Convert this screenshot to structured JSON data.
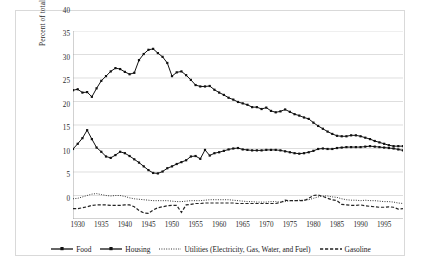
{
  "chart_data": {
    "type": "line",
    "title": "",
    "xlabel": "",
    "ylabel": "Percent of total consumer expenditures",
    "xlim": [
      1929,
      1999
    ],
    "ylim": [
      0,
      40
    ],
    "ytick_labels": [
      "0",
      "5",
      "10",
      "15",
      "20",
      "25",
      "30",
      "35",
      "40"
    ],
    "ytick_values": [
      0,
      5,
      10,
      15,
      20,
      25,
      30,
      35,
      40
    ],
    "xtick_labels": [
      "1930",
      "1935",
      "1940",
      "1945",
      "1950",
      "1955",
      "1960",
      "1965",
      "1970",
      "1975",
      "1980",
      "1985",
      "1990",
      "1995"
    ],
    "xtick_values": [
      1930,
      1935,
      1940,
      1945,
      1950,
      1955,
      1960,
      1965,
      1970,
      1975,
      1980,
      1985,
      1990,
      1995
    ],
    "grid": "horizontal",
    "legend_position": "bottom",
    "x": [
      1929,
      1930,
      1931,
      1932,
      1933,
      1934,
      1935,
      1936,
      1937,
      1938,
      1939,
      1940,
      1941,
      1942,
      1943,
      1944,
      1945,
      1946,
      1947,
      1948,
      1949,
      1950,
      1951,
      1952,
      1953,
      1954,
      1955,
      1956,
      1957,
      1958,
      1959,
      1960,
      1961,
      1962,
      1963,
      1964,
      1965,
      1966,
      1967,
      1968,
      1969,
      1970,
      1971,
      1972,
      1973,
      1974,
      1975,
      1976,
      1977,
      1978,
      1979,
      1980,
      1981,
      1982,
      1983,
      1984,
      1985,
      1986,
      1987,
      1988,
      1989,
      1990,
      1991,
      1992,
      1993,
      1994,
      1995,
      1996,
      1997,
      1998,
      1999
    ],
    "series": [
      {
        "name": "Food",
        "style": "solid-marker",
        "color": "#111111",
        "values": [
          27.4,
          27.6,
          26.9,
          27.0,
          26.0,
          27.8,
          29.4,
          30.4,
          31.4,
          32.1,
          31.9,
          31.3,
          30.8,
          31.1,
          33.8,
          35.1,
          36.0,
          36.2,
          35.3,
          34.5,
          33.2,
          30.4,
          31.2,
          31.4,
          30.6,
          29.6,
          28.5,
          28.2,
          28.2,
          28.3,
          27.5,
          26.9,
          26.4,
          25.8,
          25.4,
          24.9,
          24.6,
          24.3,
          23.8,
          23.8,
          23.4,
          23.7,
          23.0,
          22.7,
          22.9,
          23.3,
          22.8,
          22.3,
          22.0,
          21.6,
          21.3,
          20.5,
          19.8,
          19.2,
          18.6,
          18.1,
          17.7,
          17.6,
          17.6,
          17.8,
          17.8,
          17.6,
          17.3,
          17.0,
          16.6,
          16.3,
          16.0,
          15.7,
          15.5,
          15.5,
          15.5
        ]
      },
      {
        "name": "Housing",
        "style": "solid-marker",
        "color": "#111111",
        "values": [
          14.9,
          16.0,
          17.2,
          18.9,
          17.0,
          15.2,
          14.3,
          13.3,
          13.0,
          13.6,
          14.3,
          14.0,
          13.4,
          12.7,
          12.0,
          11.2,
          10.4,
          9.8,
          9.7,
          10.1,
          10.8,
          11.2,
          11.7,
          12.1,
          12.5,
          13.3,
          13.4,
          12.8,
          14.7,
          13.5,
          14.0,
          14.2,
          14.5,
          14.8,
          15.0,
          15.1,
          14.8,
          14.7,
          14.6,
          14.6,
          14.6,
          14.7,
          14.7,
          14.7,
          14.6,
          14.4,
          14.2,
          14.0,
          13.9,
          14.0,
          14.2,
          14.5,
          14.9,
          15.0,
          14.9,
          14.9,
          15.1,
          15.2,
          15.3,
          15.3,
          15.3,
          15.3,
          15.4,
          15.5,
          15.4,
          15.3,
          15.2,
          15.1,
          15.0,
          14.8,
          14.6
        ]
      },
      {
        "name": "Utilities (Electricity, Gas, Water, and Fuel)",
        "style": "dotted",
        "color": "#333333",
        "values": [
          4.3,
          4.4,
          4.7,
          5.0,
          5.3,
          5.4,
          5.2,
          5.0,
          4.9,
          5.0,
          5.0,
          4.8,
          4.5,
          4.3,
          4.2,
          4.1,
          4.0,
          3.9,
          3.9,
          3.9,
          3.9,
          3.8,
          3.7,
          3.7,
          3.8,
          3.9,
          3.9,
          3.9,
          4.0,
          4.1,
          4.1,
          4.1,
          4.1,
          4.1,
          4.0,
          3.9,
          3.8,
          3.7,
          3.7,
          3.6,
          3.6,
          3.6,
          3.7,
          3.7,
          3.6,
          3.7,
          3.9,
          3.9,
          4.0,
          4.0,
          4.1,
          4.4,
          4.7,
          4.9,
          4.9,
          4.7,
          4.6,
          4.3,
          4.1,
          4.0,
          4.0,
          3.9,
          4.0,
          3.9,
          3.9,
          3.8,
          3.7,
          3.7,
          3.6,
          3.4,
          3.3
        ]
      },
      {
        "name": "Gasoline",
        "style": "dashed",
        "color": "#222222",
        "values": [
          2.2,
          2.2,
          2.4,
          2.6,
          2.9,
          3.0,
          3.0,
          3.0,
          2.9,
          2.9,
          2.9,
          3.0,
          3.0,
          2.6,
          1.8,
          1.3,
          1.2,
          1.9,
          2.4,
          2.6,
          2.8,
          2.9,
          2.9,
          1.4,
          3.0,
          3.1,
          3.3,
          3.3,
          3.4,
          3.4,
          3.4,
          3.4,
          3.4,
          3.4,
          3.4,
          3.3,
          3.3,
          3.3,
          3.3,
          3.3,
          3.3,
          3.3,
          3.3,
          3.3,
          3.5,
          4.0,
          3.9,
          3.9,
          3.9,
          3.9,
          4.4,
          5.0,
          5.1,
          4.8,
          4.4,
          4.1,
          3.9,
          3.1,
          3.0,
          2.9,
          2.9,
          3.0,
          2.8,
          2.7,
          2.6,
          2.5,
          2.5,
          2.6,
          2.5,
          2.1,
          2.2
        ]
      }
    ]
  },
  "axis": {
    "ylabel": "Percent of total consumer expenditures"
  },
  "legend": {
    "items": [
      {
        "label": "Food",
        "key": "solid-marker-key"
      },
      {
        "label": "Housing",
        "key": "solid-marker-key"
      },
      {
        "label": "Utilities (Electricity, Gas, Water, and Fuel)",
        "key": "dotted-key"
      },
      {
        "label": "Gasoline",
        "key": "dashed-key"
      }
    ]
  }
}
